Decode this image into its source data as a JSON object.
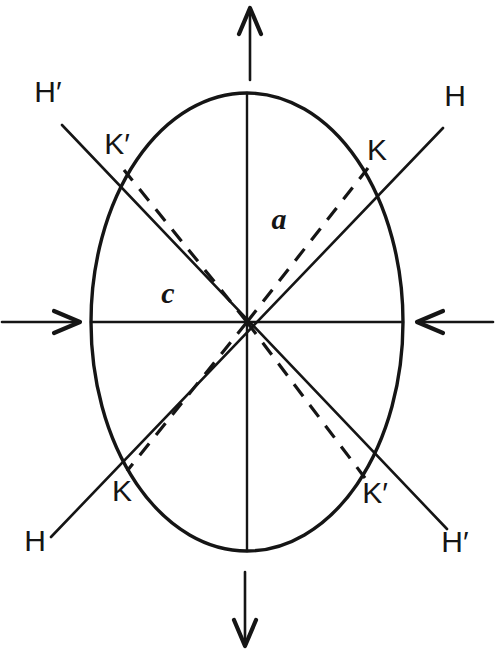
{
  "figure": {
    "caption": "",
    "background_color": "#ffffff",
    "ink_color": "#151515",
    "width": 495,
    "height": 653
  },
  "ellipse": {
    "name": "deformed-grain-outline",
    "center_x": 247,
    "center_y": 322,
    "semi_axis_horizontal": 156,
    "semi_axis_vertical": 229,
    "stroke_width": 3.4
  },
  "axes": {
    "vertical": {
      "label": "a",
      "label_x": 279,
      "label_y": 222,
      "from_y": 93,
      "to_y": 551
    },
    "horizontal": {
      "label": "c",
      "label_x": 168,
      "label_y": 296,
      "from_x": 91,
      "to_x": 403
    }
  },
  "arrows": {
    "top": {
      "name": "tension-arrow-up",
      "direction": "up",
      "x": 250,
      "tail_y": 80,
      "head_y": 8
    },
    "bottom": {
      "name": "tension-arrow-down",
      "direction": "down",
      "x": 245,
      "tail_y": 572,
      "head_y": 646
    },
    "left": {
      "name": "compression-arrow-right",
      "direction": "right",
      "y": 322,
      "tail_x": 2,
      "head_x": 80
    },
    "right": {
      "name": "compression-arrow-left",
      "direction": "left",
      "y": 322,
      "tail_x": 493,
      "head_x": 417
    }
  },
  "slip_lines": [
    {
      "name": "slip-line-h",
      "id": "H",
      "style": "solid",
      "x1": 51,
      "y1": 537,
      "x2": 443,
      "y2": 128
    },
    {
      "name": "slip-line-h-prime",
      "id": "H'",
      "style": "solid",
      "x1": 62,
      "y1": 125,
      "x2": 447,
      "y2": 529
    }
  ],
  "dashed_lines": [
    {
      "name": "dashed-slip-upper-right",
      "x1": 247,
      "y1": 322,
      "x2": 368,
      "y2": 168
    },
    {
      "name": "dashed-slip-upper-left",
      "x1": 247,
      "y1": 322,
      "x2": 124,
      "y2": 170
    },
    {
      "name": "dashed-slip-lower-left",
      "x1": 247,
      "y1": 322,
      "x2": 127,
      "y2": 471
    },
    {
      "name": "dashed-slip-lower-right",
      "x1": 247,
      "y1": 322,
      "x2": 365,
      "y2": 478
    }
  ],
  "labels": [
    {
      "name": "label-h-prime-top-left",
      "text": "H′",
      "x": 48,
      "y": 94
    },
    {
      "name": "label-k-prime-top-left",
      "text": "K′",
      "x": 117,
      "y": 146
    },
    {
      "name": "label-h-top-right",
      "text": "H",
      "x": 455,
      "y": 98
    },
    {
      "name": "label-k-top-right",
      "text": "K",
      "x": 377,
      "y": 152
    },
    {
      "name": "label-k-bottom-left",
      "text": "K",
      "x": 122,
      "y": 493
    },
    {
      "name": "label-h-bottom-left",
      "text": "H",
      "x": 35,
      "y": 543
    },
    {
      "name": "label-k-prime-bottom-right",
      "text": "K′",
      "x": 375,
      "y": 495
    },
    {
      "name": "label-h-prime-bottom-right",
      "text": "H′",
      "x": 455,
      "y": 544
    }
  ]
}
